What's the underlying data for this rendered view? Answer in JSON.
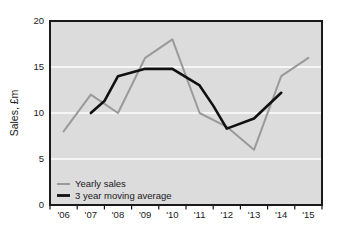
{
  "chart_data": {
    "type": "line",
    "title": "",
    "xlabel": "",
    "ylabel": "Sales, £m",
    "x": [
      "'06",
      "'07",
      "'08",
      "'09",
      "'10",
      "'11",
      "'12",
      "'13",
      "'14",
      "'15"
    ],
    "categories": [
      "'06",
      "'07",
      "'08",
      "'09",
      "'10",
      "'11",
      "'12",
      "'13",
      "'14",
      "'15"
    ],
    "ylim": [
      0,
      20
    ],
    "yticks": [
      0,
      5,
      10,
      15,
      20
    ],
    "ytick_labels": [
      "0",
      "5",
      "10",
      "15",
      "20"
    ],
    "grid": "horizontal-white",
    "legend_position": "bottom-left-inside",
    "plot_background": "#dcdcdc",
    "series": [
      {
        "name": "Yearly sales",
        "color": "#9a9a9a",
        "values": [
          8,
          12,
          10,
          16,
          18,
          10,
          8.5,
          6,
          14,
          16
        ],
        "x": [
          "'06",
          "'07",
          "'08",
          "'09",
          "'10",
          "'11",
          "'12",
          "'13",
          "'14",
          "'15"
        ]
      },
      {
        "name": "3 year moving average",
        "color": "#111111",
        "values": [
          null,
          10,
          11.3,
          14,
          14.8,
          14.8,
          13,
          10.8,
          8.3,
          9.4
        ],
        "x": [
          "'06",
          "'07",
          "'08",
          "'09",
          "'10",
          "'11",
          "'12",
          "'13",
          "'14",
          "'15"
        ],
        "note_points": [
          {
            "x": "'07",
            "y": 10
          },
          {
            "x": "'075",
            "y": 11.3
          },
          {
            "x": "'08",
            "y": 14
          },
          {
            "x": "'09",
            "y": 14.8
          },
          {
            "x": "'10",
            "y": 14.8
          },
          {
            "x": "'11",
            "y": 13
          },
          {
            "x": "'115",
            "y": 10.8
          },
          {
            "x": "'12",
            "y": 8.3
          },
          {
            "x": "'13",
            "y": 9.4
          },
          {
            "x": "'14",
            "y": 12.2
          }
        ]
      }
    ]
  },
  "legend": {
    "items": [
      {
        "label": "Yearly sales",
        "color": "#9a9a9a"
      },
      {
        "label": "3 year moving average",
        "color": "#111111"
      }
    ]
  },
  "axes": {
    "y_label": "Sales, £m",
    "y_ticks": [
      "0",
      "5",
      "10",
      "15",
      "20"
    ],
    "x_ticks": [
      "'06",
      "'07",
      "'08",
      "'09",
      "'10",
      "'11",
      "'12",
      "'13",
      "'14",
      "'15"
    ]
  }
}
